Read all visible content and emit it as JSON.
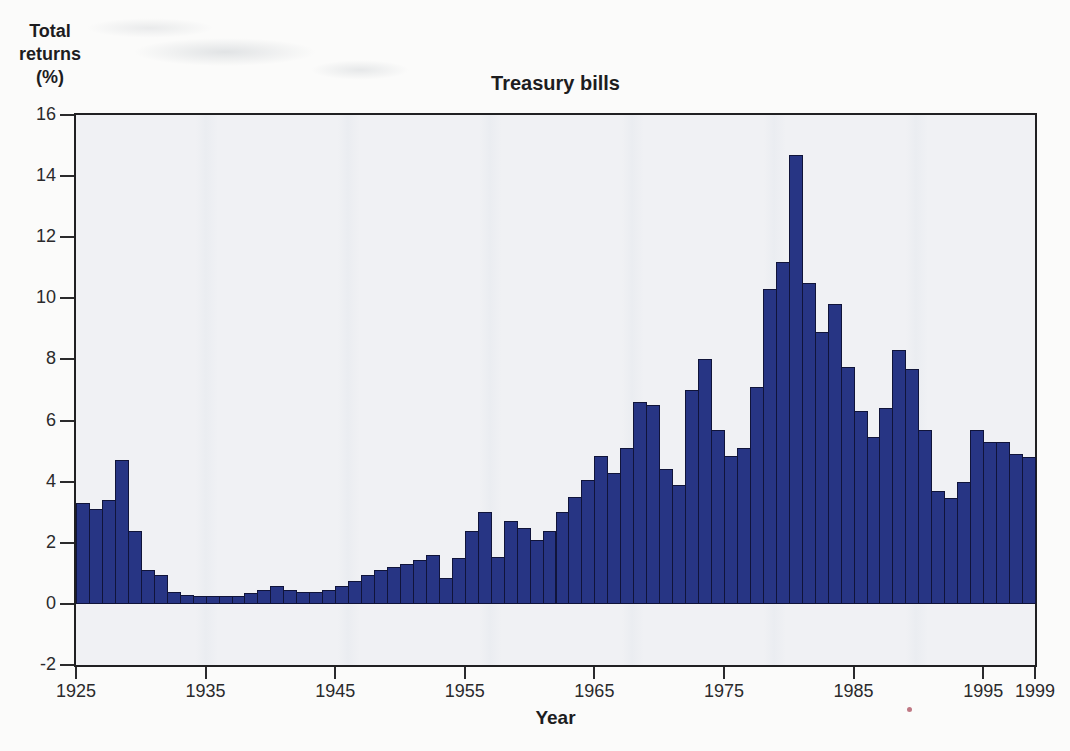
{
  "chart_data": {
    "type": "bar",
    "title": "Treasury bills",
    "xlabel": "Year",
    "ylabel": "Total returns (%)",
    "y_axis_label_lines": [
      "Total",
      "returns",
      "(%)"
    ],
    "ylim": [
      -2,
      16
    ],
    "y_ticks": [
      16,
      14,
      12,
      10,
      8,
      6,
      4,
      2,
      0,
      -2
    ],
    "x_range": [
      1925,
      1999
    ],
    "x_tick_years": [
      1925,
      1935,
      1945,
      1955,
      1965,
      1975,
      1985,
      1995,
      1999
    ],
    "grid": false,
    "legend": "none",
    "series": [
      {
        "name": "Treasury bills annual total return (%)",
        "years": [
          1926,
          1927,
          1928,
          1929,
          1930,
          1931,
          1932,
          1933,
          1934,
          1935,
          1936,
          1937,
          1938,
          1939,
          1940,
          1941,
          1942,
          1943,
          1944,
          1945,
          1946,
          1947,
          1948,
          1949,
          1950,
          1951,
          1952,
          1953,
          1954,
          1955,
          1956,
          1957,
          1958,
          1959,
          1960,
          1961,
          1962,
          1963,
          1964,
          1965,
          1966,
          1967,
          1968,
          1969,
          1970,
          1971,
          1972,
          1973,
          1974,
          1975,
          1976,
          1977,
          1978,
          1979,
          1980,
          1981,
          1982,
          1983,
          1984,
          1985,
          1986,
          1987,
          1988,
          1989,
          1990,
          1991,
          1992,
          1993,
          1994,
          1995,
          1996,
          1997,
          1998,
          1999
        ],
        "values": [
          3.3,
          3.1,
          3.4,
          4.7,
          2.4,
          1.1,
          0.95,
          0.4,
          0.3,
          0.25,
          0.25,
          0.25,
          0.25,
          0.35,
          0.45,
          0.6,
          0.45,
          0.4,
          0.4,
          0.45,
          0.6,
          0.75,
          0.95,
          1.1,
          1.2,
          1.3,
          1.45,
          1.6,
          0.85,
          1.5,
          2.4,
          3.0,
          1.55,
          2.7,
          2.5,
          2.1,
          2.4,
          3.0,
          3.5,
          4.05,
          4.85,
          4.3,
          5.1,
          6.6,
          6.5,
          4.4,
          3.9,
          7.0,
          8.0,
          5.7,
          4.85,
          5.1,
          7.1,
          10.3,
          11.2,
          14.7,
          10.5,
          8.9,
          9.8,
          7.75,
          6.3,
          5.45,
          6.4,
          8.3,
          7.7,
          5.7,
          3.7,
          3.45,
          4.0,
          5.7,
          5.3,
          5.3,
          4.9,
          4.8
        ]
      }
    ],
    "colors": {
      "bar_fill": "#273584",
      "bar_border": "#10143a",
      "plot_background": "#f0f1f4",
      "axis": "#202022",
      "text": "#1d1d1f",
      "scan_artifact_dot": "#b4606f"
    }
  }
}
